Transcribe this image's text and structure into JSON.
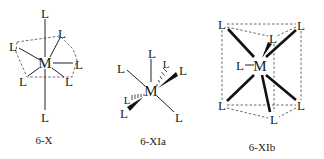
{
  "figure": {
    "structures": [
      {
        "id": "6-X",
        "caption": "6-X",
        "metal": "M",
        "ligand": "L",
        "geometry": "pentagonal pyramid with axial ligands (apex-capped)"
      },
      {
        "id": "6-XIa",
        "caption": "6-XIa",
        "metal": "M",
        "ligand": "L",
        "geometry": "trigonal prism (perspective, wedge/hash bonds)"
      },
      {
        "id": "6-XIb",
        "caption": "6-XIb",
        "metal": "M",
        "ligand": "L",
        "geometry": "capped trigonal prism"
      }
    ],
    "colors": {
      "ink": "#1a1a1a",
      "background": "#ffffff"
    }
  }
}
